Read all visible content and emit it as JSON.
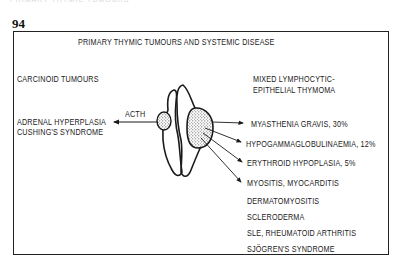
{
  "page": {
    "faint_header": "PRIMARY THYMIC TUMOURS",
    "number": "94"
  },
  "diagram": {
    "title": "PRIMARY THYMIC TUMOURS AND SYSTEMIC DISEASE",
    "left": {
      "heading": "CARCINOID TUMOURS",
      "arrow_label": "ACTH",
      "effects": [
        "ADRENAL HYPERPLASIA",
        "CUSHING'S SYNDROME"
      ]
    },
    "right": {
      "heading_line1": "MIXED LYMPHOCYTIC-",
      "heading_line2": "EPITHELIAL THYMOMA",
      "associations": [
        "MYASTHENIA GRAVIS, 30%",
        "HYPOGAMMAGLOBULINAEMIA, 12%",
        "ERYTHROID HYPOPLASIA, 5%",
        "MYOSITIS, MYOCARDITIS",
        "DERMATOMYOSITIS",
        "SCLERODERMA",
        "SLE, RHEUMATOID ARTHRITIS",
        "SJÖGREN'S SYNDROME"
      ]
    },
    "colors": {
      "ink": "#1a1a1a",
      "stipple": "#9a9a9a",
      "background": "#ffffff"
    }
  }
}
